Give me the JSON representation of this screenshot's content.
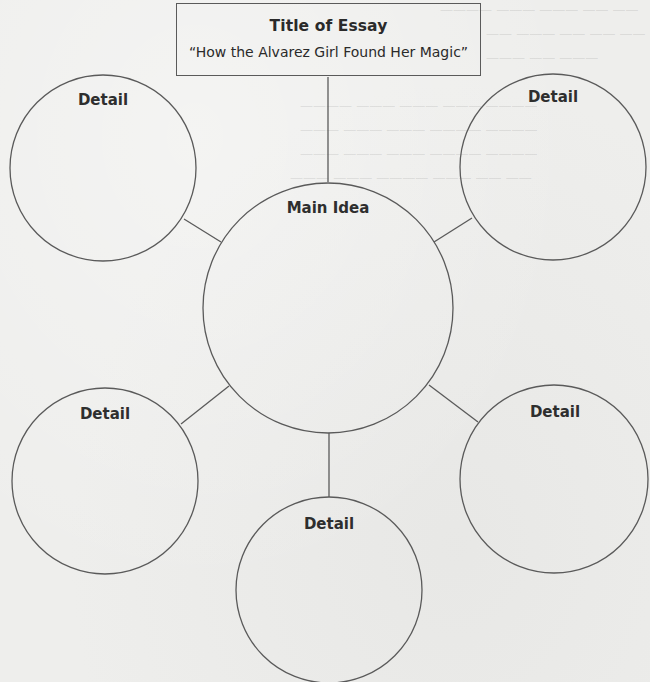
{
  "diagram": {
    "type": "cluster-web graphic organizer",
    "title_box": {
      "heading": "Title of Essay",
      "value": "“How the Alvarez Girl Found Her Magic”"
    },
    "center_node": {
      "label": "Main Idea"
    },
    "detail_nodes": [
      {
        "position": "top-left",
        "label": "Detail"
      },
      {
        "position": "top-right",
        "label": "Detail"
      },
      {
        "position": "bottom-left",
        "label": "Detail"
      },
      {
        "position": "bottom-right",
        "label": "Detail"
      },
      {
        "position": "bottom",
        "label": "Detail"
      }
    ],
    "colors": {
      "stroke": "#5a5a5a",
      "text": "#2a2a2a",
      "paper": "#eeeeec"
    }
  }
}
